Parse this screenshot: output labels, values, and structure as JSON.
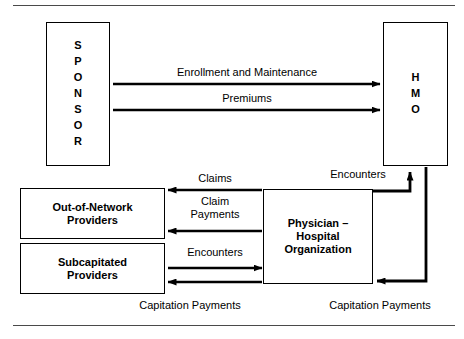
{
  "diagram": {
    "nodes": {
      "sponsor": {
        "letters": [
          "S",
          "P",
          "O",
          "N",
          "S",
          "O",
          "R"
        ],
        "text": "SPONSOR"
      },
      "hmo": {
        "letters": [
          "H",
          "M",
          "O"
        ],
        "text": "HMO"
      },
      "out_of_network": {
        "line1": "Out-of-Network",
        "line2": "Providers"
      },
      "subcapitated": {
        "line1": "Subcapitated",
        "line2": "Providers"
      },
      "pho": {
        "line1": "Physician –",
        "line2": "Hospital",
        "line3": "Organization"
      }
    },
    "flows": {
      "enrollment": "Enrollment and Maintenance",
      "premiums": "Premiums",
      "claims": "Claims",
      "claim_payments_line1": "Claim",
      "claim_payments_line2": "Payments",
      "encounters_left": "Encounters",
      "encounters_right": "Encounters",
      "capitation_left": "Capitation Payments",
      "capitation_right": "Capitation Payments"
    },
    "colors": {
      "stroke": "#000000",
      "background": "#ffffff",
      "rule": "#4a4a4a"
    }
  }
}
